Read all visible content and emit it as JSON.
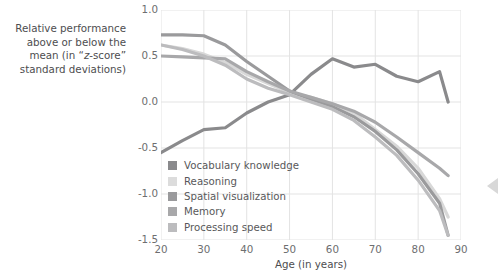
{
  "ylabel_lines": [
    "Relative performance",
    "above or below the",
    "mean (in “z-score”",
    "standard deviations)"
  ],
  "ylabel_full": "Relative performance above or below the mean (in “z-score” standard deviations)",
  "xlabel": "Age (in years)",
  "edge_arrow_icon": "triangle-left-icon",
  "chart_data": {
    "type": "line",
    "title": "",
    "subtitle": "",
    "xlabel": "Age (in years)",
    "ylabel": "Relative performance above or below the mean (in “z-score” standard deviations)",
    "xlim": [
      20,
      90
    ],
    "ylim": [
      -1.5,
      1.0
    ],
    "xticks": [
      20,
      30,
      40,
      50,
      60,
      70,
      80,
      90
    ],
    "yticks": [
      -1.5,
      -1.0,
      -0.5,
      0.0,
      0.5,
      1.0
    ],
    "xticklabels": [
      "20",
      "30",
      "40",
      "50",
      "60",
      "70",
      "80",
      "90"
    ],
    "yticklabels": [
      "-1.5",
      "-1.0",
      "-0.5",
      "0.0",
      "0.5",
      "1.0"
    ],
    "grid": true,
    "grid_color": "#e3e3e3",
    "legend_position": "inside-lower-left",
    "x": [
      20,
      25,
      30,
      35,
      40,
      45,
      50,
      55,
      60,
      65,
      70,
      75,
      80,
      85,
      87
    ],
    "series": [
      {
        "name": "Vocabulary knowledge",
        "color": "#8a8a8c",
        "values": [
          -0.55,
          -0.42,
          -0.3,
          -0.28,
          -0.12,
          0.0,
          0.08,
          0.3,
          0.47,
          0.38,
          0.41,
          0.28,
          0.22,
          0.33,
          0.0
        ]
      },
      {
        "name": "Reasoning",
        "color": "#d8d8d8",
        "values": [
          0.62,
          0.58,
          0.52,
          0.43,
          0.3,
          0.2,
          0.1,
          0.05,
          -0.02,
          -0.12,
          -0.3,
          -0.48,
          -0.72,
          -1.05,
          -1.25
        ]
      },
      {
        "name": "Spatial visualization",
        "color": "#9a9a9c",
        "values": [
          0.73,
          0.73,
          0.72,
          0.62,
          0.44,
          0.28,
          0.12,
          0.03,
          -0.05,
          -0.16,
          -0.32,
          -0.52,
          -0.78,
          -1.1,
          -1.45
        ]
      },
      {
        "name": "Memory",
        "color": "#a8a8aa",
        "values": [
          0.5,
          0.49,
          0.48,
          0.47,
          0.33,
          0.22,
          0.12,
          0.05,
          -0.02,
          -0.1,
          -0.22,
          -0.38,
          -0.55,
          -0.72,
          -0.8
        ]
      },
      {
        "name": "Processing speed",
        "color": "#bcbcbe",
        "values": [
          0.62,
          0.57,
          0.5,
          0.4,
          0.25,
          0.15,
          0.08,
          0.0,
          -0.08,
          -0.2,
          -0.38,
          -0.58,
          -0.85,
          -1.18,
          -1.45
        ]
      }
    ]
  },
  "legend": {
    "items": [
      {
        "label": "Vocabulary knowledge",
        "color": "#8a8a8c"
      },
      {
        "label": "Reasoning",
        "color": "#dcdcdc"
      },
      {
        "label": "Spatial visualization",
        "color": "#9a9a9c"
      },
      {
        "label": "Memory",
        "color": "#a8a8aa"
      },
      {
        "label": "Processing speed",
        "color": "#bcbcbe"
      }
    ]
  }
}
